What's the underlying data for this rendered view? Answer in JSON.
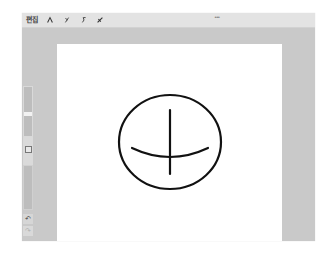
{
  "toolbar": {
    "label": "편집",
    "tools": [
      {
        "name": "pen",
        "icon": "pen-icon"
      },
      {
        "name": "pencil",
        "icon": "pencil-icon"
      },
      {
        "name": "lasso",
        "icon": "lasso-icon"
      },
      {
        "name": "eraser",
        "icon": "eraser-icon"
      }
    ],
    "more_handle": "•••"
  },
  "sidebar": {
    "brush_size_position": 0.55,
    "undo_label": "↶",
    "redo_label": "↷",
    "redo_enabled": false
  },
  "canvas": {
    "background": "#ffffff",
    "stroke_color": "#111111",
    "drawing": "circle with vertical stroke and curved horizontal stroke"
  },
  "colors": {
    "toolbar_bg": "#e3e3e3",
    "workspace_bg": "#c9c9c9",
    "paper": "#ffffff",
    "ink": "#111111"
  }
}
